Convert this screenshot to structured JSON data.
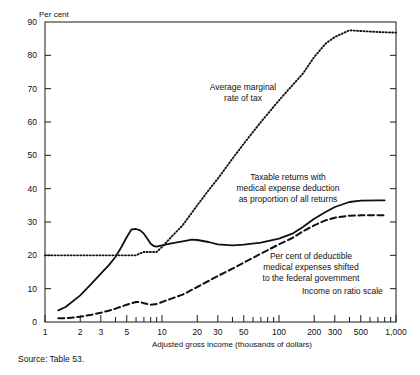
{
  "figure": {
    "unit_label": "Per cent",
    "source": "Source: Table 53.",
    "xaxis_title": "Adjusted gross income (thousands of dollars)",
    "scale_note": "Income on ratio scale"
  },
  "annotations": {
    "marginal_rate_line1": "Average marginal",
    "marginal_rate_line2": "rate of tax",
    "taxable_returns_line1": "Taxable returns with",
    "taxable_returns_line2": "medical expense deduction",
    "taxable_returns_line3": "as proportion of all returns",
    "shifted_line1": "Per cent of deductible",
    "shifted_line2": "medical expenses shifted",
    "shifted_line3": "to the federal government"
  },
  "chart_data": {
    "type": "line",
    "title": "",
    "xlabel": "Adjusted gross income (thousands of dollars)",
    "ylabel": "Per cent",
    "xscale": "log",
    "xlim": [
      1,
      1000
    ],
    "ylim": [
      0,
      90
    ],
    "grid": false,
    "legend": "inline-annotations",
    "ytick_labels": [
      "0",
      "10",
      "20",
      "30",
      "40",
      "50",
      "60",
      "70",
      "80",
      "90"
    ],
    "ytick_values": [
      0,
      10,
      20,
      30,
      40,
      50,
      60,
      70,
      80,
      90
    ],
    "xtick_labels": [
      "1",
      "2",
      "3",
      "5",
      "10",
      "20",
      "30",
      "50",
      "100",
      "200",
      "300",
      "500",
      "1,000"
    ],
    "xtick_values": [
      1,
      2,
      3,
      5,
      10,
      20,
      30,
      50,
      100,
      200,
      300,
      500,
      1000
    ],
    "xminor_values": [
      4,
      6,
      7,
      8,
      9,
      40,
      60,
      70,
      80,
      90,
      400,
      600,
      700,
      800,
      900
    ],
    "series": [
      {
        "name": "Average marginal rate of tax",
        "style": "dotted",
        "x": [
          1,
          1.5,
          2,
          3,
          4,
          5,
          6,
          6.5,
          7,
          8,
          9,
          10,
          12,
          15,
          20,
          25,
          30,
          40,
          50,
          70,
          100,
          130,
          160,
          200,
          250,
          300,
          400,
          500,
          700,
          1000
        ],
        "values": [
          20,
          20,
          20,
          20,
          20,
          20,
          20,
          20.6,
          21,
          21,
          21,
          22.5,
          25.5,
          29,
          35,
          39.5,
          43,
          49,
          53.5,
          60,
          66.5,
          71,
          74.5,
          79.5,
          83.5,
          85.5,
          87.5,
          87.3,
          87,
          86.8
        ]
      },
      {
        "name": "Taxable returns with medical expense deduction as proportion of all returns",
        "style": "solid",
        "x": [
          1.3,
          1.5,
          2,
          2.5,
          3,
          3.5,
          4,
          4.5,
          5,
          5.5,
          6,
          6.5,
          7,
          7.5,
          8,
          8.5,
          9,
          10,
          12,
          15,
          18,
          20,
          25,
          30,
          40,
          50,
          70,
          100,
          130,
          160,
          200,
          250,
          300,
          400,
          500,
          700,
          800
        ],
        "values": [
          3.5,
          4.5,
          8,
          11.5,
          14.5,
          17,
          19.5,
          22.5,
          25.5,
          27.8,
          27.9,
          27.5,
          26.5,
          25,
          23.5,
          22.8,
          22.6,
          23,
          23.6,
          24.2,
          24.7,
          24.6,
          24,
          23.3,
          23,
          23.2,
          23.8,
          25,
          26.5,
          28.5,
          31,
          33,
          34.5,
          36,
          36.4,
          36.5,
          36.5
        ]
      },
      {
        "name": "Per cent of deductible medical expenses shifted to the federal government",
        "style": "dashed",
        "x": [
          1.3,
          1.6,
          2,
          2.5,
          3,
          3.5,
          4,
          5,
          6,
          6.5,
          7,
          8,
          9,
          10,
          12,
          15,
          20,
          25,
          30,
          40,
          50,
          70,
          100,
          130,
          160,
          200,
          250,
          300,
          400,
          500,
          700,
          800
        ],
        "values": [
          1.1,
          1.2,
          1.6,
          2.2,
          2.8,
          3.4,
          4.0,
          5.2,
          6.0,
          6.0,
          5.6,
          5.2,
          5.4,
          6.0,
          7.0,
          8.2,
          10.5,
          12.3,
          13.8,
          16.0,
          17.8,
          20.5,
          23.3,
          25.2,
          27.2,
          29.0,
          30.5,
          31.3,
          31.9,
          32.0,
          32.0,
          32.0
        ]
      }
    ]
  }
}
